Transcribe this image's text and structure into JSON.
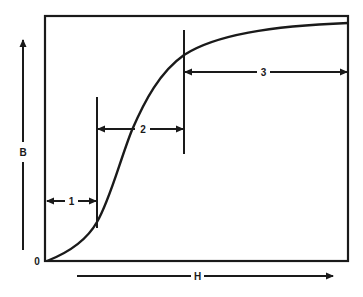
{
  "diagram": {
    "title": "",
    "type": "magnetization (B-H) curve",
    "axes": {
      "y_label": "B",
      "x_label": "H",
      "origin_label": "0"
    },
    "regions": [
      {
        "id": 1,
        "label": "1",
        "description": "initial region"
      },
      {
        "id": 2,
        "label": "2",
        "description": "steep rise region"
      },
      {
        "id": 3,
        "label": "3",
        "description": "saturation region"
      }
    ],
    "colors": {
      "ink": "#1a1a1a",
      "background": "#ffffff"
    }
  }
}
